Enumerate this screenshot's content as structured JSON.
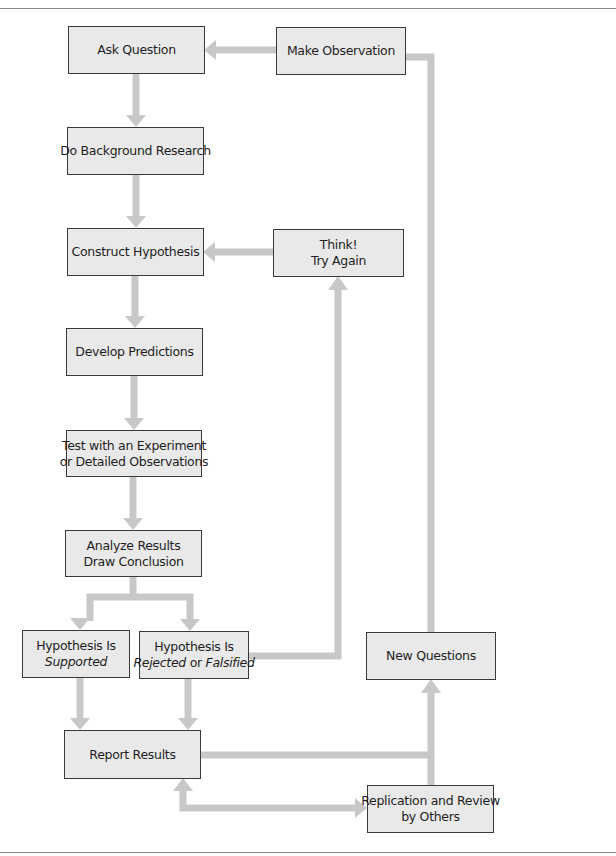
{
  "diagram": {
    "arrow_color": "#c8c8c8",
    "box_fill": "#e9e9e9",
    "box_border": "#3a3a3a",
    "nodes": {
      "ask_question": {
        "line1": "Ask Question"
      },
      "make_observation": {
        "line1": "Make Observation"
      },
      "background_research": {
        "line1": "Do Background Research"
      },
      "construct_hypothesis": {
        "line1": "Construct Hypothesis"
      },
      "think_try_again": {
        "line1": "Think!",
        "line2": "Try Again"
      },
      "develop_predictions": {
        "line1": "Develop Predictions"
      },
      "test_experiment": {
        "line1": "Test with an Experiment",
        "line2": "or Detailed Observations"
      },
      "analyze_results": {
        "line1": "Analyze Results",
        "line2": "Draw Conclusion"
      },
      "hypothesis_supported": {
        "line1": "Hypothesis Is",
        "line2": "Supported"
      },
      "hypothesis_rejected": {
        "line1": "Hypothesis Is",
        "line2a": "Rejected",
        "line2b": " or ",
        "line2c": "Falsified"
      },
      "new_questions": {
        "line1": "New Questions"
      },
      "report_results": {
        "line1": "Report Results"
      },
      "replication_review": {
        "line1": "Replication and Review",
        "line2": "by Others"
      }
    },
    "edges": [
      {
        "from": "Make Observation",
        "to": "Ask Question"
      },
      {
        "from": "Ask Question",
        "to": "Do Background Research"
      },
      {
        "from": "Do Background Research",
        "to": "Construct Hypothesis"
      },
      {
        "from": "Think! Try Again",
        "to": "Construct Hypothesis"
      },
      {
        "from": "Construct Hypothesis",
        "to": "Develop Predictions"
      },
      {
        "from": "Develop Predictions",
        "to": "Test with an Experiment or Detailed Observations"
      },
      {
        "from": "Test with an Experiment or Detailed Observations",
        "to": "Analyze Results Draw Conclusion"
      },
      {
        "from": "Analyze Results Draw Conclusion",
        "to": "Hypothesis Is Supported"
      },
      {
        "from": "Analyze Results Draw Conclusion",
        "to": "Hypothesis Is Rejected or Falsified"
      },
      {
        "from": "Hypothesis Is Rejected or Falsified",
        "to": "Think! Try Again"
      },
      {
        "from": "Hypothesis Is Supported",
        "to": "Report Results"
      },
      {
        "from": "Hypothesis Is Rejected or Falsified",
        "to": "Report Results"
      },
      {
        "from": "Report Results",
        "to": "New Questions"
      },
      {
        "from": "Report Results",
        "to": "Replication and Review by Others",
        "bidirectional": true
      },
      {
        "from": "Replication and Review by Others",
        "to": "New Questions"
      },
      {
        "from": "New Questions",
        "to": "Make Observation"
      }
    ]
  }
}
